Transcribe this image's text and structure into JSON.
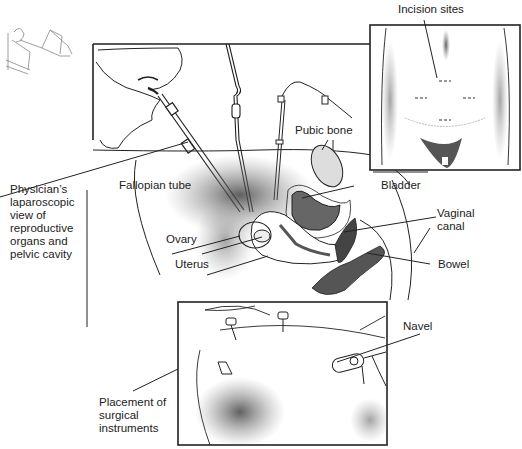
{
  "figure": {
    "labels": {
      "incision_sites": "Incision sites",
      "pubic_bone": "Pubic bone",
      "bladder": "Bladder",
      "fallopian_tube": "Fallopian tube",
      "ovary": "Ovary",
      "uterus": "Uterus",
      "vaginal_canal": "Vaginal\ncanal",
      "bowel": "Bowel",
      "physician_view": "Physician’s\nlaparoscopic\nview of\nreproductive\norgans and\npelvic cavity",
      "navel": "Navel",
      "placement": "Placement of\nsurgical\ninstruments"
    },
    "panels": [
      {
        "name": "patient-position-thumbnail"
      },
      {
        "name": "main-laparoscopy-view"
      },
      {
        "name": "incision-sites-inset"
      },
      {
        "name": "instrument-placement-inset"
      }
    ],
    "colors": {
      "ink": "#222222",
      "shade": "#555555",
      "background": "#ffffff"
    }
  }
}
